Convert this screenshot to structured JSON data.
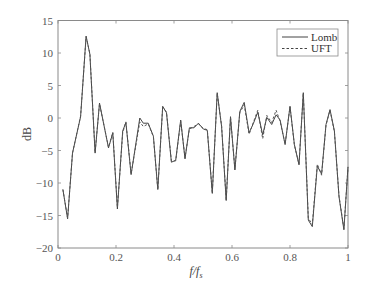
{
  "chart_data": {
    "type": "line",
    "title": "",
    "xlabel": "f/f_s",
    "ylabel": "dB",
    "xlim": [
      0,
      1
    ],
    "ylim": [
      -20,
      15
    ],
    "xticks": [
      0,
      0.2,
      0.4,
      0.6,
      0.8,
      1
    ],
    "xtick_labels": [
      "0",
      "0.2",
      "0.4",
      "0.6",
      "0.8",
      "1"
    ],
    "yticks": [
      -20,
      -15,
      -10,
      -5,
      0,
      5,
      10,
      15
    ],
    "ytick_labels": [
      "−20",
      "−15",
      "−10",
      "−5",
      "0",
      "5",
      "10",
      "15"
    ],
    "grid": false,
    "legend_position": "upper right",
    "series": [
      {
        "name": "Lomb",
        "style": "solid",
        "x": [
          0.017,
          0.033,
          0.05,
          0.078,
          0.097,
          0.11,
          0.128,
          0.143,
          0.174,
          0.189,
          0.205,
          0.223,
          0.234,
          0.252,
          0.282,
          0.294,
          0.311,
          0.329,
          0.344,
          0.361,
          0.374,
          0.391,
          0.406,
          0.423,
          0.438,
          0.453,
          0.469,
          0.484,
          0.501,
          0.515,
          0.532,
          0.549,
          0.564,
          0.58,
          0.595,
          0.61,
          0.627,
          0.642,
          0.659,
          0.674,
          0.689,
          0.706,
          0.72,
          0.737,
          0.752,
          0.766,
          0.783,
          0.8,
          0.815,
          0.831,
          0.846,
          0.863,
          0.877,
          0.894,
          0.909,
          0.924,
          0.938,
          0.953,
          0.969,
          0.986,
          1.0
        ],
        "y": [
          -11,
          -15.5,
          -5.4,
          0.2,
          12.6,
          9.8,
          -5.4,
          2.3,
          -4.6,
          -2.3,
          -14,
          -2,
          -0.7,
          -8.7,
          0,
          -0.8,
          -0.8,
          -2.8,
          -11,
          1.8,
          0.8,
          -6.8,
          -6.5,
          -0.3,
          -6.3,
          -1.5,
          -1.5,
          -0.8,
          -1.7,
          -1.9,
          -11.6,
          3.9,
          -1.3,
          -12.7,
          0.2,
          -8,
          1,
          2.4,
          -2.3,
          -0.8,
          0.9,
          -2.6,
          0.1,
          -1,
          0.5,
          -0.3,
          -4.1,
          1.8,
          -4.1,
          -7.2,
          3.9,
          -15.7,
          -16.7,
          -7.4,
          -8.6,
          -1,
          1.3,
          -2,
          -12.1,
          -17.2,
          -7.5
        ]
      },
      {
        "name": "UFT",
        "style": "dashed",
        "x": [
          0.017,
          0.033,
          0.05,
          0.078,
          0.097,
          0.11,
          0.128,
          0.143,
          0.174,
          0.189,
          0.205,
          0.223,
          0.234,
          0.252,
          0.282,
          0.294,
          0.311,
          0.329,
          0.344,
          0.361,
          0.374,
          0.391,
          0.406,
          0.423,
          0.438,
          0.453,
          0.469,
          0.484,
          0.501,
          0.515,
          0.532,
          0.549,
          0.564,
          0.58,
          0.595,
          0.61,
          0.627,
          0.642,
          0.659,
          0.674,
          0.689,
          0.706,
          0.72,
          0.737,
          0.752,
          0.766,
          0.783,
          0.8,
          0.815,
          0.831,
          0.846,
          0.863,
          0.877,
          0.894,
          0.909,
          0.924,
          0.938,
          0.953,
          0.969,
          0.986,
          1.0
        ],
        "y": [
          -11,
          -15.4,
          -5.4,
          0.3,
          12.5,
          9.9,
          -5.3,
          2.2,
          -4.5,
          -2.2,
          -13.8,
          -2.3,
          -0.6,
          -8.6,
          -0.6,
          -1.3,
          -0.9,
          -2.9,
          -11,
          1.7,
          0.9,
          -6.6,
          -6.6,
          -0.5,
          -6.1,
          -1.7,
          -1.3,
          -0.9,
          -1.6,
          -1.8,
          -11.5,
          3.8,
          -1.2,
          -12.6,
          0.1,
          -7.9,
          0.8,
          2.0,
          -2.5,
          -0.6,
          1.2,
          -3.2,
          0.4,
          -0.7,
          1.2,
          -0.5,
          -4.0,
          1.7,
          -4.2,
          -7.1,
          3.8,
          -15.4,
          -16.4,
          -7.1,
          -8.8,
          -1.1,
          1.2,
          -2.1,
          -12.0,
          -17.0,
          -7.6
        ]
      }
    ]
  },
  "legend": {
    "items": [
      {
        "label": "Lomb",
        "style": "solid"
      },
      {
        "label": "UFT",
        "style": "dashed"
      }
    ]
  },
  "axes": {
    "xlabel_main": "f/f",
    "xlabel_sub": "s",
    "ylabel": "dB"
  }
}
